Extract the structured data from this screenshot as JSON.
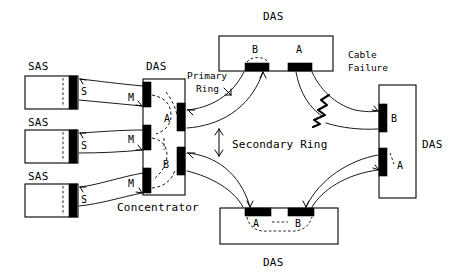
{
  "diagram": {
    "colors": {
      "line": "#000000",
      "fill": "#ffffff",
      "port_block": "#000000"
    },
    "annotations": {
      "primary_ring": "Primary\nRing",
      "primary_ring_line1": "Primary",
      "primary_ring_line2": "Ring",
      "secondary_ring": "Secondary Ring",
      "cable_failure_line1": "Cable",
      "cable_failure_line2": "Failure",
      "concentrator": "Concentrator"
    },
    "stations": {
      "sas": [
        {
          "label": "SAS",
          "port": "S",
          "link_label": "M"
        },
        {
          "label": "SAS",
          "port": "S",
          "link_label": "M"
        },
        {
          "label": "SAS",
          "port": "S",
          "link_label": "M"
        }
      ],
      "concentrator": {
        "label": "DAS",
        "caption": "Concentrator",
        "ports_left": [
          "M",
          "M",
          "M"
        ],
        "ports_right": [
          "A",
          "B"
        ]
      },
      "das_top": {
        "label": "DAS",
        "ports": [
          "B",
          "A"
        ]
      },
      "das_right": {
        "label": "DAS",
        "ports": [
          "B",
          "A"
        ]
      },
      "das_bottom": {
        "label": "DAS",
        "ports": [
          "A",
          "B"
        ]
      }
    }
  }
}
